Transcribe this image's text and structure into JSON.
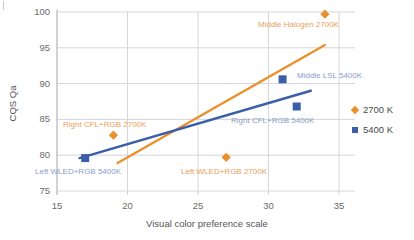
{
  "chart_data": {
    "type": "scatter",
    "title": "",
    "xlabel": "Visual color preference scale",
    "ylabel": "CQS Qa",
    "xlim": [
      15,
      35
    ],
    "ylim": [
      75,
      100
    ],
    "xticks": [
      15,
      20,
      25,
      30,
      35
    ],
    "yticks": [
      75,
      80,
      85,
      90,
      95,
      100
    ],
    "grid": true,
    "legend_position": "right",
    "series": [
      {
        "name": "2700 K",
        "color": "#e8912d",
        "marker": "diamond",
        "points": [
          {
            "x": 19.0,
            "y": 82.8,
            "label": "Right CFL+RGB 2700K"
          },
          {
            "x": 27.0,
            "y": 79.7,
            "label": "Left WLED+RGB 2700K"
          },
          {
            "x": 34.0,
            "y": 99.7,
            "label": "Middle Halogen 2700K"
          }
        ],
        "trendline": {
          "x0": 19.3,
          "y0": 78.9,
          "x1": 34.0,
          "y1": 95.4
        }
      },
      {
        "name": "5400 K",
        "color": "#3a5fa8",
        "marker": "square",
        "points": [
          {
            "x": 17.0,
            "y": 79.6,
            "label": "Left WLED+RGB 5400K"
          },
          {
            "x": 31.0,
            "y": 90.6,
            "label": "Middle LSL 5400K"
          },
          {
            "x": 32.0,
            "y": 86.8,
            "label": "Right CFL+RGB 5400K"
          }
        ],
        "trendline": {
          "x0": 16.6,
          "y0": 79.6,
          "x1": 33.0,
          "y1": 89.0
        }
      }
    ]
  },
  "axes": {
    "x_title": "Visual color preference scale",
    "y_title": "CQS Qa",
    "x_tick_labels": [
      "15",
      "20",
      "25",
      "30",
      "35"
    ],
    "y_tick_labels": [
      "75",
      "80",
      "85",
      "90",
      "95",
      "100"
    ]
  },
  "legend": {
    "items": [
      {
        "label": "2700 K",
        "marker": "diamond-marker",
        "color": "#e8912d"
      },
      {
        "label": "5400 K",
        "marker": "square-marker",
        "color": "#3a5fa8"
      }
    ]
  },
  "annotations": [
    {
      "text": "Middle Halogen 2700K",
      "color": "#e8a05c",
      "left": 258,
      "top": 20
    },
    {
      "text": "Middle LSL 5400K",
      "color": "#8b9dc9",
      "left": 297,
      "top": 71
    },
    {
      "text": "Right CFL+RGB 5400K",
      "color": "#8b9dc9",
      "left": 231,
      "top": 116
    },
    {
      "text": "Right CFL+RGB 2700K",
      "color": "#e8a05c",
      "left": 63,
      "top": 120
    },
    {
      "text": "Left WLED+RGB 5400K",
      "color": "#8b9dc9",
      "left": 35,
      "top": 167
    },
    {
      "text": "Left WLED+RGB 2700K",
      "color": "#e8a05c",
      "left": 181,
      "top": 167
    }
  ],
  "colors": {
    "series_2700k": "#e8912d",
    "series_5400k": "#3a5fa8",
    "grid": "#d6d6d6",
    "axis_text": "#6a6a6a"
  }
}
